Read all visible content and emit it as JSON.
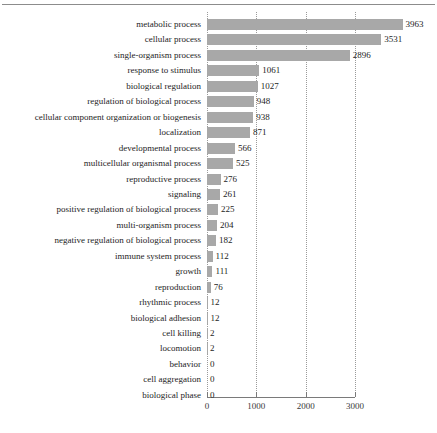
{
  "chart_data": {
    "type": "bar",
    "orientation": "horizontal",
    "title": "",
    "xlabel": "",
    "ylabel": "",
    "xlim": [
      0,
      3000
    ],
    "grid": true,
    "legend": null,
    "bar_color": "#a8a8a8",
    "xticks": [
      0,
      1000,
      2000,
      3000
    ],
    "xtick_labels": [
      "0",
      "1000",
      "2000",
      "3000"
    ],
    "categories": [
      "metabolic process",
      "cellular process",
      "single-organism process",
      "response to stimulus",
      "biological regulation",
      "regulation of biological process",
      "cellular component organization or biogenesis",
      "localization",
      "developmental process",
      "multicellular organismal process",
      "reproductive process",
      "signaling",
      "positive regulation of biological process",
      "multi-organism process",
      "negative regulation of biological process",
      "immune system process",
      "growth",
      "reproduction",
      "rhythmic process",
      "biological adhesion",
      "cell killing",
      "locomotion",
      "behavior",
      "cell aggregation",
      "biological phase"
    ],
    "values": [
      3963,
      3531,
      2896,
      1061,
      1027,
      948,
      938,
      871,
      566,
      525,
      276,
      261,
      225,
      204,
      182,
      112,
      111,
      76,
      12,
      12,
      2,
      2,
      0,
      0,
      0
    ],
    "value_labels": [
      "3963",
      "3531",
      "2896",
      "1061",
      "1027",
      "948",
      "938",
      "871",
      "566",
      "525",
      "276",
      "261",
      "225",
      "204",
      "182",
      "112",
      "111",
      "76",
      "12",
      "12",
      "2",
      "2",
      "0",
      "0",
      "0"
    ]
  }
}
